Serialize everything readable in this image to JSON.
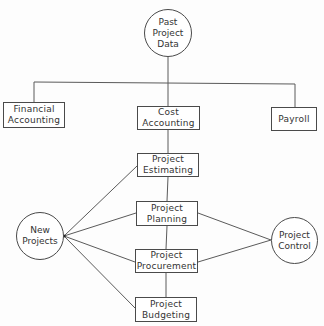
{
  "diagram": {
    "nodes": {
      "past_project_data": {
        "label": "Past\nProject\nData",
        "shape": "circle"
      },
      "financial_accounting": {
        "label": "Financial\nAccounting",
        "shape": "box"
      },
      "cost_accounting": {
        "label": "Cost\nAccounting",
        "shape": "box"
      },
      "payroll": {
        "label": "Payroll",
        "shape": "box"
      },
      "project_estimating": {
        "label": "Project\nEstimating",
        "shape": "box"
      },
      "project_planning": {
        "label": "Project\nPlanning",
        "shape": "box"
      },
      "project_procurement": {
        "label": "Project\nProcurement",
        "shape": "box"
      },
      "project_budgeting": {
        "label": "Project\nBudgeting",
        "shape": "box"
      },
      "new_projects": {
        "label": "New\nProjects",
        "shape": "circle"
      },
      "project_control": {
        "label": "Project\nControl",
        "shape": "circle"
      }
    },
    "edges": [
      [
        "past_project_data",
        "financial_accounting"
      ],
      [
        "past_project_data",
        "cost_accounting"
      ],
      [
        "past_project_data",
        "payroll"
      ],
      [
        "cost_accounting",
        "project_estimating"
      ],
      [
        "project_estimating",
        "project_planning"
      ],
      [
        "project_planning",
        "project_procurement"
      ],
      [
        "project_procurement",
        "project_budgeting"
      ],
      [
        "new_projects",
        "project_estimating"
      ],
      [
        "new_projects",
        "project_planning"
      ],
      [
        "new_projects",
        "project_procurement"
      ],
      [
        "new_projects",
        "project_budgeting"
      ],
      [
        "project_planning",
        "project_control"
      ],
      [
        "project_procurement",
        "project_control"
      ]
    ],
    "colors": {
      "line": "#5a5a5a",
      "text": "#333333",
      "background": "#fdfdfd"
    }
  }
}
